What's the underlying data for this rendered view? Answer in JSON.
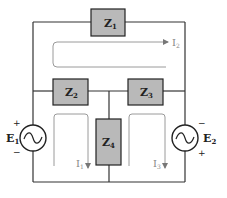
{
  "diagram": {
    "type": "circuit",
    "colors": {
      "wire": "#333333",
      "box_fill": "#b9b9b9",
      "box_stroke": "#222222",
      "loop": "#9a9a9a"
    },
    "impedances": [
      {
        "id": "Z1",
        "label": "Z",
        "sub": "1"
      },
      {
        "id": "Z2",
        "label": "Z",
        "sub": "2"
      },
      {
        "id": "Z3",
        "label": "Z",
        "sub": "3"
      },
      {
        "id": "Z4",
        "label": "Z",
        "sub": "4"
      }
    ],
    "sources": [
      {
        "id": "E1",
        "label": "E",
        "sub": "1",
        "top_sign": "+",
        "bottom_sign": "−"
      },
      {
        "id": "E2",
        "label": "E",
        "sub": "2",
        "top_sign": "−",
        "bottom_sign": "+"
      }
    ],
    "currents": [
      {
        "id": "I1",
        "label": "I",
        "sub": "1"
      },
      {
        "id": "I2",
        "label": "I",
        "sub": "2"
      },
      {
        "id": "I3",
        "label": "I",
        "sub": "3"
      }
    ]
  }
}
